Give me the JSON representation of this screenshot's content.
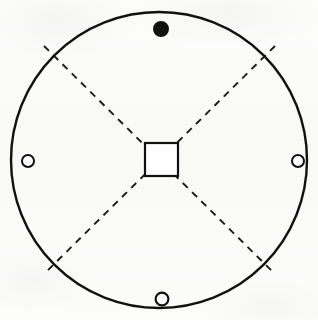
{
  "figure": {
    "canvas": {
      "width": 318,
      "height": 320
    },
    "background_color": "#fbfbf9",
    "ink_color": "#111111"
  },
  "outline_circle": {
    "label": "plate-outline",
    "center_x": 159,
    "center_y": 160,
    "radius": 148,
    "stroke_color": "#111111",
    "stroke_width": 2.4,
    "fill": "none"
  },
  "center_square": {
    "label": "central square opening",
    "x": 145,
    "y": 143,
    "width": 33,
    "height": 33,
    "stroke_color": "#111111",
    "stroke_width": 2.2,
    "fill_color": "#ffffff"
  },
  "dashed_lines": {
    "label": "diagonal centre lines",
    "stroke_color": "#1a1a1a",
    "stroke_width": 1.9,
    "dash_length": 7,
    "gap_length": 6,
    "segments": [
      {
        "name": "diagonal-nw-se",
        "x1": 44,
        "y1": 46,
        "x2": 275,
        "y2": 274
      },
      {
        "name": "diagonal-ne-sw",
        "x1": 275,
        "y1": 46,
        "x2": 44,
        "y2": 274
      }
    ]
  },
  "markers": [
    {
      "name": "marker-top-filled",
      "position": "top",
      "style": "filled",
      "cx": 161,
      "cy": 29,
      "r": 7.2,
      "fill_color": "#111111",
      "stroke_color": "#111111",
      "stroke_width": 1.6
    },
    {
      "name": "marker-left-hollow",
      "position": "left",
      "style": "hollow",
      "cx": 28,
      "cy": 161,
      "r": 6.0,
      "fill_color": "#ffffff",
      "stroke_color": "#111111",
      "stroke_width": 2.0
    },
    {
      "name": "marker-right-hollow",
      "position": "right",
      "style": "hollow",
      "cx": 298,
      "cy": 161,
      "r": 6.0,
      "fill_color": "#ffffff",
      "stroke_color": "#111111",
      "stroke_width": 2.0
    },
    {
      "name": "marker-bottom-hollow",
      "position": "bottom",
      "style": "hollow",
      "cx": 162,
      "cy": 299,
      "r": 6.4,
      "fill_color": "#ffffff",
      "stroke_color": "#111111",
      "stroke_width": 2.2
    }
  ]
}
